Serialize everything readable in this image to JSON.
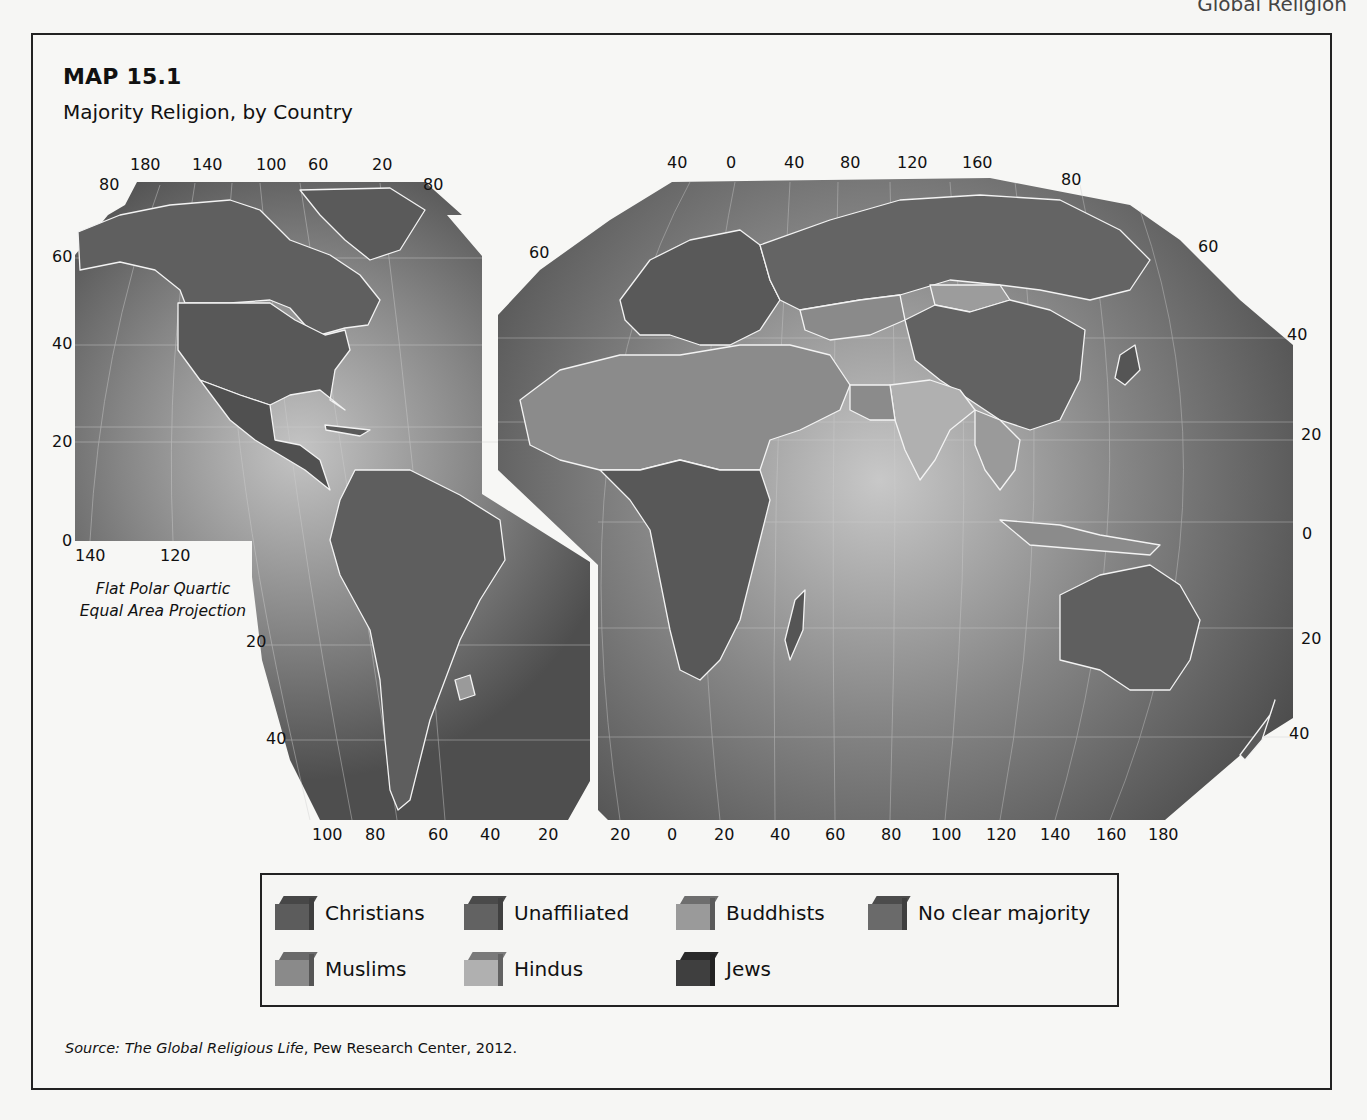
{
  "page": {
    "running_header": "Global Religion"
  },
  "map": {
    "title": "MAP 15.1",
    "subtitle": "Majority Religion, by Country",
    "projection_line1": "Flat Polar Quartic",
    "projection_line2": "Equal Area Projection",
    "ticks": {
      "left_top": [
        "180",
        "140",
        "100",
        "60",
        "20"
      ],
      "left_lat_left": [
        "80",
        "60",
        "40",
        "20",
        "0"
      ],
      "left_lat_right": [
        "80"
      ],
      "left_bottom_inner": [
        "140",
        "120"
      ],
      "left_lat_sa": [
        "20",
        "40"
      ],
      "left_bottom": [
        "100",
        "80",
        "60",
        "40",
        "20"
      ],
      "right_top": [
        "40",
        "0",
        "40",
        "80",
        "120",
        "160"
      ],
      "right_lat_left": [
        "60"
      ],
      "right_lat_right": [
        "80",
        "60",
        "40",
        "20",
        "0",
        "20",
        "40"
      ],
      "right_bottom": [
        "20",
        "0",
        "20",
        "40",
        "60",
        "80",
        "100",
        "120",
        "140",
        "160",
        "180"
      ]
    },
    "colors": {
      "ocean_dark": "#505050",
      "ocean_light": "#b9b9b9",
      "border": "#f2f2f2"
    }
  },
  "legend": {
    "items": [
      {
        "label": "Christians",
        "front": "#5c5c5c",
        "top": "#474747",
        "side": "#3e3e3e"
      },
      {
        "label": "Unaffiliated",
        "front": "#626262",
        "top": "#4a4a4a",
        "side": "#404040"
      },
      {
        "label": "Buddhists",
        "front": "#9a9a9a",
        "top": "#6e6e6e",
        "side": "#5a5a5a"
      },
      {
        "label": "No clear majority",
        "front": "#6a6a6a",
        "top": "#4c4c4c",
        "side": "#3f3f3f"
      },
      {
        "label": "Muslims",
        "front": "#8a8a8a",
        "top": "#6a6a6a",
        "side": "#555555"
      },
      {
        "label": "Hindus",
        "front": "#b0b0b0",
        "top": "#7a7a7a",
        "side": "#626262"
      },
      {
        "label": "Jews",
        "front": "#3f3f3f",
        "top": "#2a2a2a",
        "side": "#222222"
      }
    ]
  },
  "source": {
    "prefix": "Source: ",
    "title": "The Global Religious Life",
    "rest": ", Pew Research Center, 2012."
  }
}
